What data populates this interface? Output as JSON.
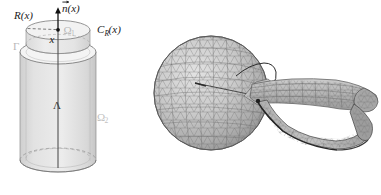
{
  "figure": {
    "caption": "",
    "background_color": "#ffffff",
    "width": 381,
    "height": 195
  },
  "panels": [
    {
      "id": "left",
      "name": "cylinder-schematic",
      "description": "Schematic of a vertical circular cylinder split into an upper thin disc region and a lower tall region, with a central vertical axis segment and a point on the upper cap."
    },
    {
      "id": "right",
      "name": "mesh-rendering",
      "description": "Three-dimensional triangulated finite element surface mesh: a large sphere at left joined by a narrow neck to an elongated tapering tubular body extending to the right with a looped lower strut."
    }
  ],
  "left_diagram": {
    "labels": {
      "radius": "R(x)",
      "normal_vector": "n(x)",
      "normal_vector_accent": "⃗",
      "cylinder_curve": "C",
      "cylinder_curve_sub": "R",
      "cylinder_curve_arg": "(x)",
      "point": "x",
      "omega_upper": "Ω",
      "omega_upper_sub": "1",
      "omega_lower": "Ω",
      "omega_lower_sub": "2",
      "gamma": "Γ",
      "lambda": "Λ"
    }
  },
  "colors": {
    "outline": "#4a4a4a",
    "outline_dark": "#1a1a1a",
    "fill_body": "#dcdcdc",
    "fill_cap": "#f0f0f0",
    "fill_top": "#e8e8e8",
    "faint_label": "#b8b8b8",
    "mesh_line": "#5d5d5d",
    "mesh_fill_light": "#cfcfcf",
    "mesh_fill_mid": "#b4b4b4",
    "mesh_fill_dark": "#9a9a9a",
    "mesh_stroke_dark": "#2b2b2b"
  }
}
